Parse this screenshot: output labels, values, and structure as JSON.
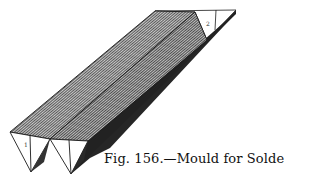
{
  "figure": {
    "caption": "Fig. 156.—Mould for Solder.",
    "end_labels": [
      "1",
      "2"
    ],
    "colors": {
      "outline": "#1a1a1a",
      "top_face": "#8f8f8f",
      "shadow_face": "#2a2a2a",
      "background": "#ffffff"
    }
  }
}
